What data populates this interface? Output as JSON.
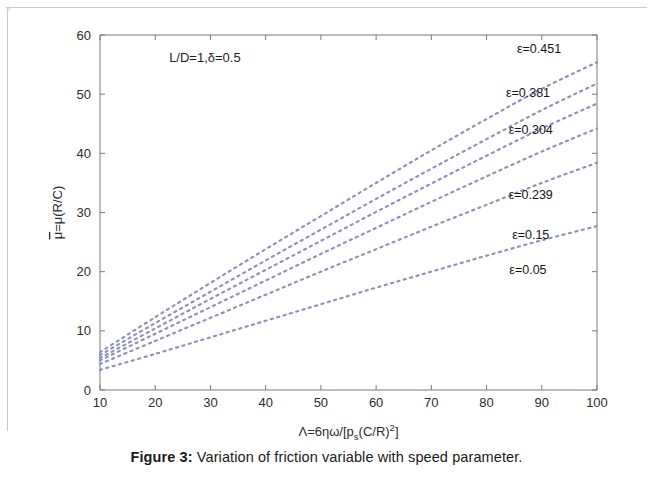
{
  "figure": {
    "label": "Figure 3:",
    "caption": " Variation of friction variable with speed parameter."
  },
  "annotation": {
    "params": "L/D=1,δ=0.5"
  },
  "axis": {
    "x_title_parts": {
      "main": "Λ=6ηω/[p",
      "sub": "s",
      "mid": "(C/R)",
      "sup": "2",
      "end": "]"
    },
    "y_title_parts": {
      "bar": "μ",
      "main": "=μ(R/C)"
    }
  },
  "style": {
    "curve_color": "#8b8fbe",
    "axis_color": "#7a7a7a",
    "text_color": "#1e1e1e",
    "background": "#ffffff"
  },
  "chart_data": {
    "type": "line",
    "title": "Variation of friction variable with speed parameter",
    "xlabel": "Λ=6ηω/[p_s(C/R)^2]",
    "ylabel": "μ̄=μ(R/C)",
    "xlim": [
      10,
      100
    ],
    "ylim": [
      0,
      60
    ],
    "xticks": [
      10,
      20,
      30,
      40,
      50,
      60,
      70,
      80,
      90,
      100
    ],
    "yticks": [
      0,
      10,
      20,
      30,
      40,
      50,
      60
    ],
    "grid": false,
    "legend_position": "inline-right-of-curve-ends",
    "linestyle": "dotted",
    "annotations": [
      "L/D=1,δ=0.5"
    ],
    "x": [
      10,
      20,
      30,
      40,
      50,
      60,
      70,
      80,
      90,
      100
    ],
    "series": [
      {
        "name": "ε=0.451",
        "label": "ε=0.451",
        "values": [
          6.4,
          12.3,
          18.1,
          23.8,
          29.4,
          35.0,
          40.5,
          45.8,
          50.9,
          55.4
        ],
        "label_xy": [
          89.5,
          57.0
        ]
      },
      {
        "name": "ε=0.381",
        "label": "ε=0.381",
        "values": [
          5.9,
          11.3,
          16.6,
          21.9,
          27.1,
          32.3,
          37.4,
          42.4,
          47.3,
          51.8
        ],
        "label_xy": [
          87.5,
          49.6
        ]
      },
      {
        "name": "ε=0.304",
        "label": "ε=0.304",
        "values": [
          5.4,
          10.4,
          15.4,
          20.3,
          25.2,
          30.1,
          34.9,
          39.6,
          44.2,
          48.4
        ],
        "label_xy": [
          88.0,
          43.2
        ]
      },
      {
        "name": "ε=0.239",
        "label": "ε=0.239",
        "values": [
          5.0,
          9.5,
          14.0,
          18.5,
          23.0,
          27.4,
          31.8,
          36.1,
          40.3,
          44.2
        ],
        "label_xy": [
          88.0,
          32.2
        ]
      },
      {
        "name": "ε=0.15",
        "label": "ε=0.15",
        "values": [
          4.4,
          8.3,
          12.2,
          16.1,
          20.0,
          23.8,
          27.6,
          31.3,
          35.0,
          38.4
        ],
        "label_xy": [
          88.0,
          25.6
        ]
      },
      {
        "name": "ε=0.05",
        "label": "ε=0.05",
        "values": [
          3.4,
          6.1,
          8.9,
          11.7,
          14.5,
          17.3,
          20.0,
          22.7,
          25.3,
          27.7
        ],
        "label_xy": [
          87.5,
          19.6
        ]
      }
    ]
  }
}
